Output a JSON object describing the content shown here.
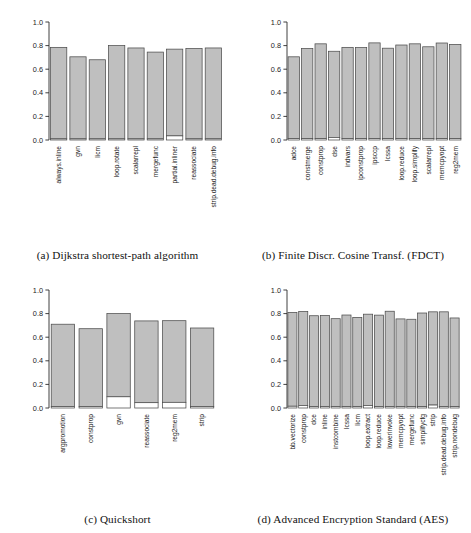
{
  "figure": {
    "panels": [
      {
        "key": "a",
        "caption": "(a) Dijkstra shortest-path algorithm",
        "chart_data": {
          "type": "bar",
          "title": "Dijkstra shortest-path algorithm",
          "xlabel": "",
          "ylabel": "",
          "ylim": [
            0,
            1.0
          ],
          "yticks": [
            "0.0",
            "0.2",
            "0.4",
            "0.6",
            "0.8",
            "1.0"
          ],
          "ytickvalues": [
            0,
            0.2,
            0.4,
            0.6,
            0.8,
            1.0
          ],
          "grid": false,
          "legend": "none",
          "stacked": true,
          "categories": [
            "always.inline",
            "gvn",
            "licm",
            "loop.rotate",
            "scalarrepl",
            "mergefunc",
            "partial.inliner",
            "reassociate",
            "strip.dead.debug.info"
          ],
          "series": [
            {
              "name": "base",
              "values": [
                0.01,
                0.01,
                0.01,
                0.01,
                0.01,
                0.01,
                0.035,
                0.01,
                0.01
              ]
            },
            {
              "name": "total",
              "values": [
                0.785,
                0.705,
                0.68,
                0.8,
                0.78,
                0.745,
                0.77,
                0.775,
                0.78
              ]
            }
          ]
        }
      },
      {
        "key": "b",
        "caption": "(b) Finite Discr. Cosine Transf. (FDCT)",
        "chart_data": {
          "type": "bar",
          "title": "Finite Discr. Cosine Transf. (FDCT)",
          "xlabel": "",
          "ylabel": "",
          "ylim": [
            0,
            1.0
          ],
          "yticks": [
            "0.0",
            "0.2",
            "0.4",
            "0.6",
            "0.8",
            "1.0"
          ],
          "ytickvalues": [
            0,
            0.2,
            0.4,
            0.6,
            0.8,
            1.0
          ],
          "grid": false,
          "legend": "none",
          "stacked": true,
          "categories": [
            "adce",
            "constmerge",
            "constprop",
            "dse",
            "indvars",
            "ipconstprop",
            "ipsccp",
            "lcssa",
            "loop.reduce",
            "loop.simplify",
            "scalarrepl",
            "memcpyopt",
            "reg2mem"
          ],
          "series": [
            {
              "name": "base",
              "values": [
                0.012,
                0.012,
                0.012,
                0.022,
                0.012,
                0.012,
                0.012,
                0.012,
                0.012,
                0.012,
                0.012,
                0.012,
                0.012
              ]
            },
            {
              "name": "total",
              "values": [
                0.705,
                0.775,
                0.815,
                0.752,
                0.785,
                0.783,
                0.823,
                0.778,
                0.805,
                0.815,
                0.79,
                0.822,
                0.81
              ]
            }
          ]
        }
      },
      {
        "key": "c",
        "caption": "(c) Quickshort",
        "chart_data": {
          "type": "bar",
          "title": "Quickshort",
          "xlabel": "",
          "ylabel": "",
          "ylim": [
            0,
            1.0
          ],
          "yticks": [
            "0.0",
            "0.2",
            "0.4",
            "0.6",
            "0.8",
            "1.0"
          ],
          "ytickvalues": [
            0,
            0.2,
            0.4,
            0.6,
            0.8,
            1.0
          ],
          "grid": false,
          "legend": "none",
          "stacked": true,
          "categories": [
            "argpromotion",
            "constprop",
            "gvn",
            "reassociate",
            "reg2mem",
            "strip"
          ],
          "series": [
            {
              "name": "base",
              "values": [
                0.012,
                0.012,
                0.095,
                0.045,
                0.048,
                0.012
              ]
            },
            {
              "name": "total",
              "values": [
                0.71,
                0.672,
                0.8,
                0.738,
                0.74,
                0.678
              ]
            }
          ]
        }
      },
      {
        "key": "d",
        "caption": "(d) Advanced Encryption Standard (AES)",
        "chart_data": {
          "type": "bar",
          "title": "Advanced Encryption Standard (AES)",
          "xlabel": "",
          "ylabel": "",
          "ylim": [
            0,
            1.0
          ],
          "yticks": [
            "0.0",
            "0.2",
            "0.4",
            "0.6",
            "0.8",
            "1.0"
          ],
          "ytickvalues": [
            0,
            0.2,
            0.4,
            0.6,
            0.8,
            1.0
          ],
          "grid": false,
          "legend": "none",
          "stacked": true,
          "categories": [
            "bb.vectorize",
            "constprop",
            "dce",
            "inline",
            "instcombine",
            "lcssa",
            "licm",
            "loop.extract",
            "loop.reduce",
            "lowerinvoke",
            "memcpyopt",
            "mergefunc",
            "simplifycfg",
            "strip",
            "strip.dead.debug.info",
            "strip.nondebug"
          ],
          "series": [
            {
              "name": "base",
              "values": [
                0.015,
                0.022,
                0.012,
                0.012,
                0.012,
                0.012,
                0.012,
                0.022,
                0.012,
                0.012,
                0.012,
                0.012,
                0.012,
                0.025,
                0.012,
                0.012
              ]
            },
            {
              "name": "total",
              "values": [
                0.81,
                0.818,
                0.782,
                0.783,
                0.757,
                0.788,
                0.768,
                0.795,
                0.787,
                0.82,
                0.755,
                0.752,
                0.805,
                0.815,
                0.815,
                0.763
              ]
            }
          ]
        }
      }
    ]
  },
  "colors": {
    "bar_fill": "#bfbfbf",
    "bar_stroke": "#4d4d4d",
    "base_fill": "#ffffff",
    "axis": "#2b2b2b",
    "text": "#1a1a1a"
  }
}
